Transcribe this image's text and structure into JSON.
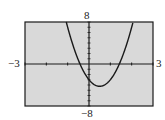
{
  "chart_data": {
    "type": "line",
    "title": "",
    "xlabel": "",
    "ylabel": "",
    "xlim": [
      -3,
      3
    ],
    "ylim": [
      -8,
      8
    ],
    "grid": false,
    "x_tick_spacing": 1,
    "y_tick_spacing": 1,
    "series": [
      {
        "name": "parabola",
        "equation_estimate": "y = 5x^2 - 5x - 3",
        "x": [
          -0.9,
          -0.6,
          -0.42,
          -0.2,
          0,
          0.2,
          0.5,
          0.8,
          1.0,
          1.2,
          1.42,
          1.7,
          1.9
        ],
        "y": [
          5.55,
          1.8,
          0.0,
          -1.8,
          -3.0,
          -3.8,
          -4.25,
          -3.8,
          -3.0,
          -1.8,
          0.0,
          3.95,
          5.55
        ]
      }
    ],
    "window_labels": {
      "ymax": "8",
      "ymin": "−8",
      "xmin": "−3",
      "xmax": "3"
    },
    "colors": {
      "background": "#d9d9d9",
      "curve": "#1a1a1a",
      "frame": "#1a1a1a"
    }
  }
}
